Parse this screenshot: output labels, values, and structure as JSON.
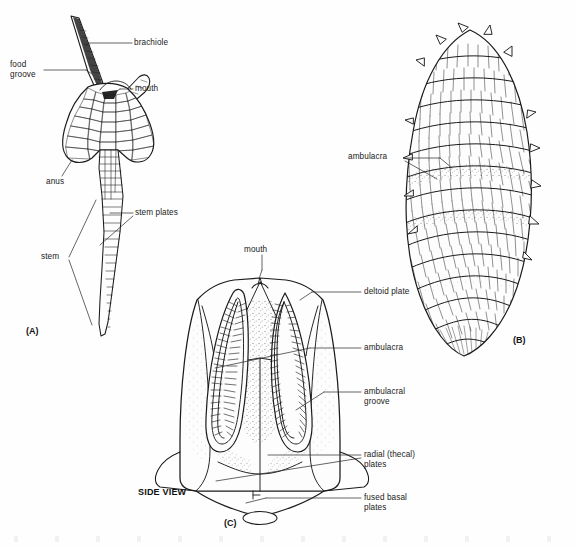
{
  "figure": {
    "background_color": "#fefefe",
    "ink_color": "#1a1a1a",
    "width": 577,
    "height": 546
  },
  "panels": [
    {
      "id": "A",
      "id_label": "(A)",
      "name": "stemmed blastozoan with brachiole",
      "labels": [
        {
          "key": "brachiole",
          "text": "brachiole"
        },
        {
          "key": "food_groove",
          "text": "food\ngroove"
        },
        {
          "key": "mouth",
          "text": "mouth"
        },
        {
          "key": "anus",
          "text": "anus"
        },
        {
          "key": "stem_plates",
          "text": "stem plates"
        },
        {
          "key": "stem",
          "text": "stem"
        }
      ]
    },
    {
      "id": "B",
      "id_label": "(B)",
      "name": "plated theca with spiral ambulacra",
      "labels": [
        {
          "key": "ambulacra",
          "text": "ambulacra"
        }
      ]
    },
    {
      "id": "C",
      "id_label": "(C)",
      "name": "blastoid theca side view",
      "view_label": "SIDE VIEW",
      "labels": [
        {
          "key": "mouth",
          "text": "mouth"
        },
        {
          "key": "deltoid_plate",
          "text": "deltoid plate"
        },
        {
          "key": "ambulacra",
          "text": "ambulacra"
        },
        {
          "key": "ambulacral_groove",
          "text": "ambulacral\ngroove"
        },
        {
          "key": "radial_plates",
          "text": "radial (thecal)\nplates"
        },
        {
          "key": "fused_basal",
          "text": "fused basal\nplates"
        }
      ]
    }
  ]
}
